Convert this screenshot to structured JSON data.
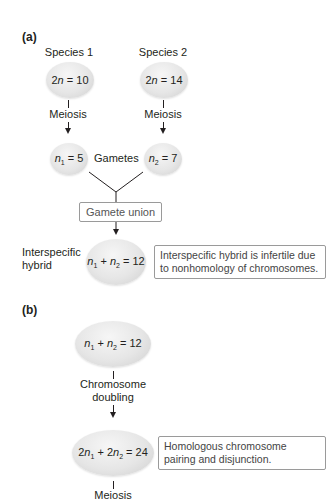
{
  "panel_a": {
    "label": "(a)",
    "species1": {
      "name": "Species 1",
      "chromosomes": "2n = 10"
    },
    "species2": {
      "name": "Species 2",
      "chromosomes": "2n = 14"
    },
    "meiosis_label": "Meiosis",
    "gamete1": "n1 = 5",
    "gamete2": "n2 = 7",
    "gametes_label": "Gametes",
    "union_label": "Gamete union",
    "hybrid_label_line1": "Interspecific",
    "hybrid_label_line2": "hybrid",
    "hybrid": "n1 + n2 = 12",
    "hybrid_note": "Interspecific hybrid is infertile due to nonhomology of chromosomes."
  },
  "panel_b": {
    "label": "(b)",
    "start": "n1 + n2 = 12",
    "doubling_line1": "Chromosome",
    "doubling_line2": "doubling",
    "result": "2n1 + 2n2 = 24",
    "result_note": "Homologous chromosome pairing and disjunction.",
    "meiosis_label": "Meiosis"
  },
  "colors": {
    "cell_fill": "#e6e6e6",
    "text": "#231f20",
    "note_border": "#9a9a9a"
  }
}
